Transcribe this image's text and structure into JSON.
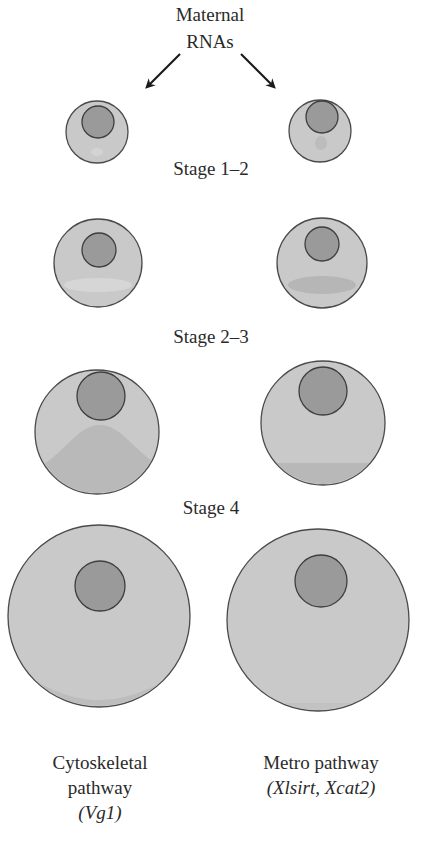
{
  "title": {
    "line1": "Maternal",
    "line2": "RNAs"
  },
  "stages": [
    {
      "label": "Stage 1–2"
    },
    {
      "label": "Stage 2–3"
    },
    {
      "label": "Stage 4"
    }
  ],
  "pathways": {
    "left": {
      "line1": "Cytoskeletal",
      "line2": "pathway",
      "line3": "(Vg1)"
    },
    "right": {
      "line1": "Metro pathway",
      "line2": "(Xlsirt, Xcat2)"
    }
  },
  "colors": {
    "cytoplasm": "#c9c9c9",
    "nucleus": "#9a9a9a",
    "outline": "#4a4a4a",
    "localized_rna": "#b4b4b4",
    "arrow": "#1a1a1a"
  }
}
